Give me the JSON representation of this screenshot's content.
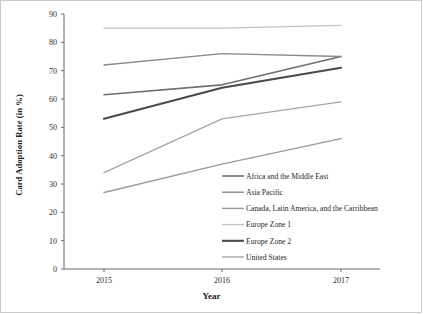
{
  "chart_data": {
    "type": "line",
    "title": "",
    "xlabel": "Year",
    "ylabel": "Card Adoption Rate (in %)",
    "categories": [
      "2015",
      "2016",
      "2017"
    ],
    "x_tick_labels": [
      "2015",
      "2016",
      "2017"
    ],
    "y_tick_labels": [
      "0",
      "10",
      "20",
      "30",
      "40",
      "50",
      "60",
      "70",
      "80",
      "90"
    ],
    "ylim": [
      0,
      90
    ],
    "y_tick_step": 10,
    "grid": false,
    "legend_position": "inside-bottom-right",
    "series": [
      {
        "name": "Africa and the Middle East",
        "color": "#6f6f6f",
        "width": 1.6,
        "values": [
          61.5,
          65,
          75
        ]
      },
      {
        "name": "Asia Pacific",
        "color": "#8a8a8a",
        "width": 1.4,
        "values": [
          72,
          76,
          75
        ]
      },
      {
        "name": "Canada, Latin America, and the Carribbean",
        "color": "#9a9a9a",
        "width": 1.4,
        "values": [
          27,
          37,
          46
        ]
      },
      {
        "name": "Europe Zone 1",
        "color": "#c4c4c4",
        "width": 1.4,
        "values": [
          85,
          85,
          86
        ]
      },
      {
        "name": "Europe Zone 2",
        "color": "#4a4a4a",
        "width": 2.1,
        "values": [
          53,
          64,
          71
        ]
      },
      {
        "name": "United States",
        "color": "#a5a5a5",
        "width": 1.4,
        "values": [
          34,
          53,
          59
        ]
      }
    ]
  }
}
